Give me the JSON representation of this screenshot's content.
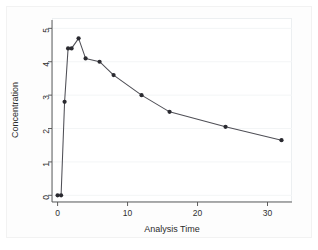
{
  "chart_data": {
    "type": "line",
    "title": "",
    "xlabel": "Analysis Time",
    "ylabel": "Concentration",
    "xlim": [
      -0.8,
      33.5
    ],
    "ylim": [
      -0.2,
      5.25
    ],
    "xticks": [
      0,
      10,
      20,
      30
    ],
    "yticks": [
      0,
      1,
      2,
      3,
      4,
      5
    ],
    "grid": true,
    "grid_axis": "y",
    "legend": false,
    "marker": "filled-circle",
    "series": [
      {
        "name": "Concentration",
        "color": "#2a2a30",
        "x": [
          0,
          0.5,
          1,
          1.5,
          2,
          3,
          4,
          6,
          8,
          12,
          16,
          24,
          32
        ],
        "y": [
          0,
          0,
          2.8,
          4.4,
          4.4,
          4.7,
          4.1,
          4.0,
          3.6,
          3.0,
          2.5,
          2.05,
          1.65
        ]
      }
    ]
  },
  "axes": {
    "x_tick_labels": [
      "0",
      "10",
      "20",
      "30"
    ],
    "y_tick_labels": [
      "0",
      "1",
      "2",
      "3",
      "4",
      "5"
    ],
    "x_title": "Analysis Time",
    "y_title": "Concentration"
  },
  "colors": {
    "background": "#ffffff",
    "graph_region": "#fdfdfd",
    "axis": "#4d4d4d",
    "gridline": "#f3f5f6",
    "line": "#4f4f56",
    "marker": "#2a2a30"
  }
}
